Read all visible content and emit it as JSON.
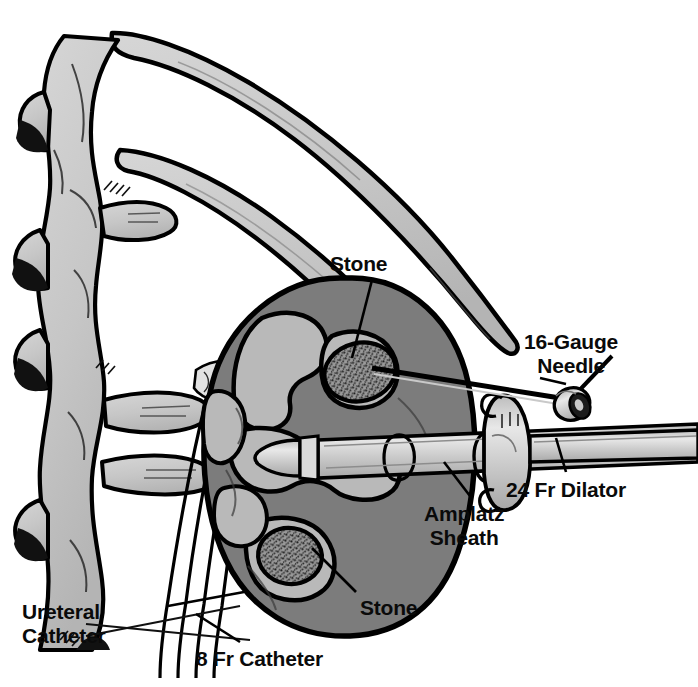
{
  "figure": {
    "background_color": "#ffffff",
    "width": 698,
    "height": 687
  },
  "palette": {
    "outline": "#000000",
    "bone_fill": "#c9c9c9",
    "kidney_parenchyma": "#7c7c7c",
    "collecting_system": "#b9b9b9",
    "stone_fill": "#8a8a8a",
    "instrument_fill": "#c6c6c6",
    "instrument_highlight": "#e4e4e4",
    "label_color": "#0a0a0a"
  },
  "labels": {
    "stone_upper": "Stone",
    "needle": "16-Gauge\nNeedle",
    "dilator": "24 Fr Dilator",
    "amplatz_sheath": "Amplatz\nSheath",
    "stone_lower": "Stone",
    "ureteral_catheter": "Ureteral\nCatheter",
    "catheter_8fr": "8 Fr Catheter"
  },
  "anatomy": {
    "spine": "lumbar vertebral column with transverse processes",
    "ribs": "two curved posterior ribs",
    "kidney": "right kidney in coronal section",
    "stones": [
      {
        "name": "upper-pole-stone",
        "position": "upper calyx"
      },
      {
        "name": "lower-pole-stone",
        "position": "lower calyx"
      }
    ]
  },
  "instruments": [
    {
      "name": "16-gauge-needle",
      "label": "16-Gauge Needle",
      "target": "upper calyceal stone"
    },
    {
      "name": "24-fr-dilator",
      "label": "24 Fr Dilator",
      "target": "renal pelvis"
    },
    {
      "name": "amplatz-sheath",
      "label": "Amplatz Sheath",
      "target": "percutaneous tract"
    },
    {
      "name": "ureteral-catheter",
      "label": "Ureteral Catheter",
      "target": "ureter"
    },
    {
      "name": "8-fr-catheter",
      "label": "8 Fr Catheter",
      "target": "ureter"
    }
  ]
}
